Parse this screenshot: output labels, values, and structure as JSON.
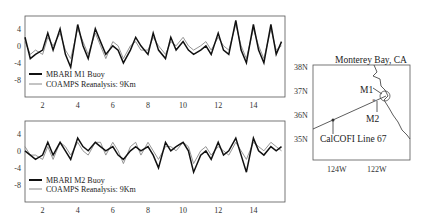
{
  "chart_data": [
    {
      "type": "line",
      "title": "",
      "xlabel": "",
      "ylabel": "",
      "xlim": [
        1,
        15.8
      ],
      "ylim": [
        -12,
        7
      ],
      "xticks": [
        "2",
        "4",
        "6",
        "8",
        "10",
        "12",
        "14"
      ],
      "yticks": [
        "4",
        "0",
        "-4",
        "-8"
      ],
      "legend": [
        "MBARI M1 Buoy",
        "COAMPS Reanalysis: 9Km"
      ],
      "series": [
        {
          "name": "MBARI M1 Buoy",
          "color": "#1a1a1a",
          "x": [
            1,
            1.3,
            1.6,
            2,
            2.3,
            2.6,
            3,
            3.3,
            3.6,
            4,
            4.3,
            4.6,
            5,
            5.3,
            5.6,
            6,
            6.3,
            6.6,
            7,
            7.3,
            7.6,
            8,
            8.3,
            8.6,
            9,
            9.3,
            9.6,
            10,
            10.3,
            10.6,
            11,
            11.3,
            11.6,
            12,
            12.3,
            12.6,
            13,
            13.3,
            13.6,
            14,
            14.3,
            14.6,
            15,
            15.3,
            15.6
          ],
          "y": [
            2,
            -3,
            -2,
            -1,
            3,
            -1,
            4,
            -2,
            -5,
            5,
            0,
            -3,
            4,
            1,
            -2,
            0,
            -1,
            -4,
            -1,
            2,
            0,
            -2,
            3,
            -1,
            -3,
            2,
            -1,
            1,
            -1,
            -2,
            -1,
            0,
            -2,
            3,
            -1,
            -2,
            6,
            -1,
            -4,
            5,
            -1,
            -4,
            5,
            -2,
            1
          ]
        },
        {
          "name": "COAMPS Reanalysis: 9Km",
          "color": "#888888",
          "x": [
            1,
            1.3,
            1.6,
            2,
            2.3,
            2.6,
            3,
            3.3,
            3.6,
            4,
            4.3,
            4.6,
            5,
            5.3,
            5.6,
            6,
            6.3,
            6.6,
            7,
            7.3,
            7.6,
            8,
            8.3,
            8.6,
            9,
            9.3,
            9.6,
            10,
            10.3,
            10.6,
            11,
            11.3,
            11.6,
            12,
            12.3,
            12.6,
            13,
            13.3,
            13.6,
            14,
            14.3,
            14.6,
            15,
            15.3,
            15.6
          ],
          "y": [
            1,
            -2,
            -1,
            -2,
            2,
            0,
            3,
            -1,
            -3,
            4,
            1,
            -2,
            3,
            0,
            -3,
            1,
            0,
            -3,
            0,
            1,
            -1,
            -1,
            2,
            0,
            -2,
            1,
            0,
            2,
            0,
            -1,
            0,
            1,
            -1,
            2,
            0,
            -1,
            5,
            0,
            -3,
            4,
            0,
            -3,
            4,
            -1,
            0
          ]
        }
      ]
    },
    {
      "type": "line",
      "title": "",
      "xlabel": "",
      "ylabel": "",
      "xlim": [
        1,
        15.8
      ],
      "ylim": [
        -12,
        7
      ],
      "xticks": [
        "2",
        "4",
        "6",
        "8",
        "10",
        "12",
        "14"
      ],
      "yticks": [
        "4",
        "0",
        "-4",
        "-8"
      ],
      "legend": [
        "MBARI M2 Buoy",
        "COAMPS Reanalysis: 9Km"
      ],
      "series": [
        {
          "name": "MBARI M2 Buoy",
          "color": "#1a1a1a",
          "x": [
            1,
            1.3,
            1.6,
            2,
            2.3,
            2.6,
            3,
            3.3,
            3.6,
            4,
            4.3,
            4.6,
            5,
            5.3,
            5.6,
            6,
            6.3,
            6.6,
            7,
            7.3,
            7.6,
            8,
            8.3,
            8.6,
            9,
            9.3,
            9.6,
            10,
            10.3,
            10.6,
            11,
            11.3,
            11.6,
            12,
            12.3,
            12.6,
            13,
            13.3,
            13.6,
            14,
            14.3,
            14.6,
            15,
            15.3,
            15.6
          ],
          "y": [
            0,
            -1,
            -2,
            -1,
            2,
            -1,
            2,
            0,
            -2,
            3,
            1,
            0,
            2,
            1,
            0,
            1,
            -1,
            -2,
            0,
            1,
            0,
            1,
            -1,
            -4,
            2,
            0,
            1,
            2,
            0,
            -5,
            -1,
            0,
            -2,
            2,
            -1,
            0,
            3,
            -1,
            -5,
            3,
            0,
            -1,
            1,
            0,
            1
          ]
        },
        {
          "name": "COAMPS Reanalysis: 9Km",
          "color": "#888888",
          "x": [
            1,
            1.3,
            1.6,
            2,
            2.3,
            2.6,
            3,
            3.3,
            3.6,
            4,
            4.3,
            4.6,
            5,
            5.3,
            5.6,
            6,
            6.3,
            6.6,
            7,
            7.3,
            7.6,
            8,
            8.3,
            8.6,
            9,
            9.3,
            9.6,
            10,
            10.3,
            10.6,
            11,
            11.3,
            11.6,
            12,
            12.3,
            12.6,
            13,
            13.3,
            13.6,
            14,
            14.3,
            14.6,
            15,
            15.3,
            15.6
          ],
          "y": [
            1,
            -1,
            -1,
            -2,
            1,
            -2,
            2,
            1,
            -1,
            2,
            0,
            -1,
            2,
            2,
            -1,
            2,
            0,
            -3,
            1,
            2,
            -1,
            2,
            0,
            -2,
            1,
            1,
            0,
            2,
            1,
            -3,
            0,
            1,
            -1,
            1,
            0,
            -1,
            2,
            0,
            -2,
            2,
            1,
            0,
            2,
            1,
            0
          ]
        }
      ]
    }
  ],
  "map": {
    "title": "Monterey Bay, CA",
    "lat_ticks": [
      "38N",
      "37N",
      "36N",
      "35N"
    ],
    "lon_ticks": [
      "124W",
      "122W"
    ],
    "labels": {
      "m1": "M1",
      "m2": "M2",
      "calcofi": "CalCOFI Line 67"
    }
  },
  "panel1": {
    "legend1": "MBARI M1 Buoy",
    "legend2": "COAMPS Reanalysis: 9Km"
  },
  "panel2": {
    "legend1": "MBARI M2 Buoy",
    "legend2": "COAMPS Reanalysis: 9Km"
  }
}
